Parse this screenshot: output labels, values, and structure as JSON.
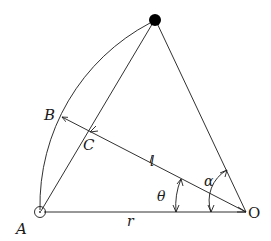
{
  "diagram": {
    "type": "geometry",
    "points": {
      "top": {
        "x": 155,
        "y": 20,
        "marker": "filled-circle"
      },
      "A": {
        "x": 40,
        "y": 212,
        "marker": "open-circle-with-dot",
        "label": "A"
      },
      "O": {
        "x": 246,
        "y": 212,
        "label": "O"
      },
      "B": {
        "x": 61,
        "y": 117,
        "label": "B"
      },
      "C": {
        "x": 90,
        "y": 132,
        "label": "C"
      }
    },
    "segments": [
      {
        "from": "A",
        "to": "O",
        "label": "r"
      },
      {
        "from": "O",
        "to": "B",
        "label": "l",
        "arrow": "B"
      },
      {
        "from": "A",
        "to": "top"
      },
      {
        "from": "O",
        "to": "top"
      }
    ],
    "arcs": [
      {
        "from": "A",
        "to": "top",
        "center": "O",
        "desc": "circular arc of radius r"
      }
    ],
    "angles": [
      {
        "label": "θ",
        "between": [
          "OA",
          "OB"
        ],
        "vertex": "O"
      },
      {
        "label": "α",
        "between": [
          "OA",
          "O-top"
        ],
        "vertex": "O"
      }
    ],
    "labels": {
      "A": "A",
      "B": "B",
      "C": "C",
      "O": "O",
      "l": "l",
      "r": "r",
      "theta": "θ",
      "alpha": "α"
    },
    "colors": {
      "stroke": "#1a1a1a",
      "background": "#ffffff"
    }
  }
}
